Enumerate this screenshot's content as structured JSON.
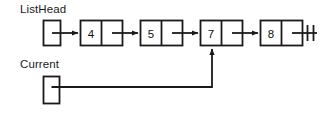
{
  "diagram": {
    "background_color": "#ffffff",
    "stroke_color": "#1a1a1a",
    "text_color": "#1a1a1a"
  },
  "labels": {
    "list_head": "ListHead",
    "current": "Current"
  },
  "pointers": [
    {
      "name": "ListHead",
      "label": "ListHead",
      "box": {
        "x": 43,
        "y": 20,
        "w": 17,
        "h": 25
      },
      "points_to": "node-4"
    },
    {
      "name": "Current",
      "label": "Current",
      "box": {
        "x": 43,
        "y": 76,
        "w": 16,
        "h": 27
      },
      "points_to": "node-7"
    }
  ],
  "nodes": [
    {
      "id": "node-4",
      "value": "4",
      "x": 80,
      "y": 20,
      "w": 42,
      "h": 25,
      "next": "node-5"
    },
    {
      "id": "node-5",
      "value": "5",
      "x": 140,
      "y": 20,
      "w": 42,
      "h": 25,
      "next": "node-7"
    },
    {
      "id": "node-7",
      "value": "7",
      "x": 200,
      "y": 20,
      "w": 42,
      "h": 25,
      "next": "node-8"
    },
    {
      "id": "node-8",
      "value": "8",
      "x": 260,
      "y": 20,
      "w": 42,
      "h": 25,
      "next": "null"
    }
  ],
  "terminator": {
    "name": "null-terminator",
    "symbol": "ground-null-marker",
    "x": 302,
    "y": 33
  }
}
